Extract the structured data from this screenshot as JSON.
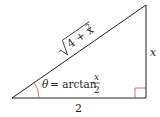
{
  "diagram": {
    "type": "right-triangle",
    "hypotenuse_label": {
      "radicand": "4 + x",
      "exponent": "2",
      "full": "√(4 + x²)"
    },
    "vertical_side_label": "x",
    "base_label": "2",
    "angle_label": {
      "symbol": "θ",
      "equals": "= arctan",
      "numerator": "x",
      "denominator": "2"
    },
    "colors": {
      "lines": "#231f20",
      "angle_arc": "#c8504a",
      "right_angle_marker": "#c8504a",
      "text": "#231f20"
    }
  }
}
